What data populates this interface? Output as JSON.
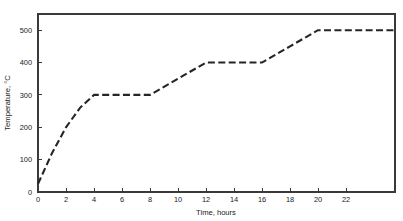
{
  "chart_data": {
    "type": "line",
    "title": "",
    "xlabel": "Time, hours",
    "ylabel": "Temperature, °C",
    "xlim": [
      0,
      25.5
    ],
    "ylim": [
      0,
      550
    ],
    "grid": false,
    "legend": null,
    "line_style": "dashed",
    "line_color": "#252525",
    "xticks": [
      0,
      2,
      4,
      6,
      8,
      10,
      12,
      14,
      16,
      18,
      20,
      22
    ],
    "xtick_labels": [
      "0",
      "2",
      "4",
      "6",
      "8",
      "10",
      "12",
      "14",
      "16",
      "18",
      "20",
      "22"
    ],
    "yticks": [
      0,
      100,
      200,
      300,
      400,
      500
    ],
    "ytick_labels": [
      "0",
      "100",
      "200",
      "300",
      "400",
      "500"
    ],
    "series": [
      {
        "name": "Heating schedule",
        "x": [
          0,
          1,
          2,
          3,
          4,
          8,
          10,
          12,
          16,
          18,
          20,
          25.5
        ],
        "y": [
          25,
          120,
          200,
          260,
          300,
          300,
          350,
          400,
          400,
          450,
          500,
          500
        ]
      }
    ],
    "annotations": [
      {
        "label": "hold at 300 °C",
        "x_range": [
          4,
          8
        ],
        "y": 300
      },
      {
        "label": "hold at 400 °C",
        "x_range": [
          12,
          16
        ],
        "y": 400
      },
      {
        "label": "hold at 500 °C",
        "x_range": [
          20,
          25.5
        ],
        "y": 500
      }
    ]
  },
  "axes": {
    "x_title": "Time, hours",
    "y_title": "Temperature, °C"
  }
}
